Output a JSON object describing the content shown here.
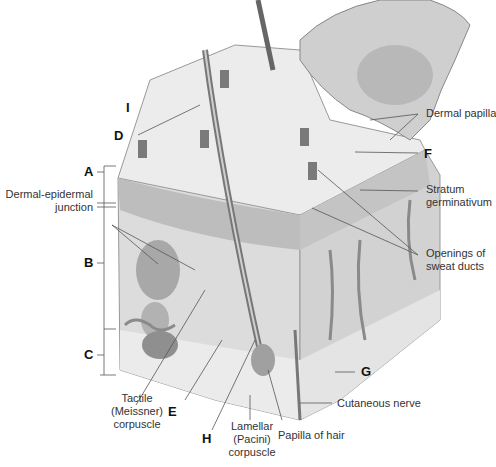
{
  "diagram": {
    "letters": {
      "A": "A",
      "B": "B",
      "C": "C",
      "D": "D",
      "E": "E",
      "F": "F",
      "G": "G",
      "H": "H",
      "I": "I"
    },
    "labels": {
      "dermal_epidermal_junction_1": "Dermal-epidermal",
      "dermal_epidermal_junction_2": "junction",
      "dermal_papilla": "Dermal papilla",
      "stratum_germinativum_1": "Stratum",
      "stratum_germinativum_2": "germinativum",
      "openings_sweat_ducts_1": "Openings of",
      "openings_sweat_ducts_2": "sweat ducts",
      "tactile_1": "Tactile",
      "tactile_2": "(Meissner)",
      "tactile_3": "corpuscle",
      "lamellar_1": "Lamellar",
      "lamellar_2": "(Pacini)",
      "lamellar_3": "corpuscle",
      "papilla_of_hair": "Papilla of hair",
      "cutaneous_nerve": "Cutaneous nerve"
    },
    "colors": {
      "background": "#ffffff",
      "tissue_light": "#e6e6e6",
      "tissue_mid": "#c8c8c8",
      "tissue_dark": "#9a9a9a",
      "leader_line": "#555555",
      "text": "#333333"
    }
  }
}
